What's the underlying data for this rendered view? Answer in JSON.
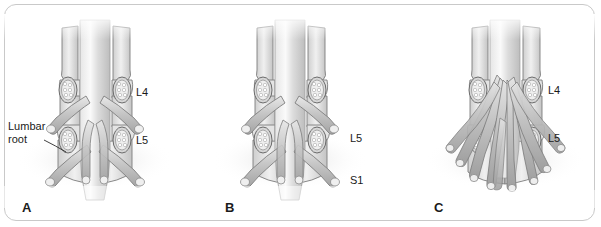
{
  "figure": {
    "type": "medical-illustration",
    "background_color": "#ffffff",
    "frame_color": "#c9c9c9",
    "panel_count": 3
  },
  "palette": {
    "ink": "#1a1a1a",
    "outline": "#6e6e6e",
    "bone_light": "#ececec",
    "bone_mid": "#d2d2d2",
    "bone_dark": "#b4b4b4",
    "root_light": "#e2e2e2",
    "root_mid": "#bdbdbd",
    "root_dark": "#9a9a9a",
    "sac_light": "#f2f2f2",
    "sac_mid": "#d8d8d8",
    "shadow": "#cfcfcf"
  },
  "panels": [
    {
      "id": "A",
      "letter": "A",
      "letter_x": 22,
      "letter_y": 200,
      "center_x": 95,
      "root_count": 4,
      "root_style": "splayed",
      "labels": [
        {
          "name": "lumbar-root",
          "text": "Lumbar\nroot",
          "x": 8,
          "y": 120,
          "align": "left"
        },
        {
          "name": "l4",
          "text": "L4",
          "x": 136,
          "y": 86,
          "align": "left"
        },
        {
          "name": "l5",
          "text": "L5",
          "x": 136,
          "y": 134,
          "align": "left"
        }
      ]
    },
    {
      "id": "B",
      "letter": "B",
      "letter_x": 225,
      "letter_y": 200,
      "center_x": 290,
      "root_count": 4,
      "root_style": "splayed",
      "labels": [
        {
          "name": "l5",
          "text": "L5",
          "x": 350,
          "y": 132,
          "align": "left"
        },
        {
          "name": "s1",
          "text": "S1",
          "x": 350,
          "y": 174,
          "align": "left"
        }
      ]
    },
    {
      "id": "C",
      "letter": "C",
      "letter_x": 434,
      "letter_y": 200,
      "center_x": 505,
      "root_count": 9,
      "root_style": "redundant-crowded",
      "labels": [
        {
          "name": "l4",
          "text": "L4",
          "x": 548,
          "y": 84,
          "align": "left"
        },
        {
          "name": "l5",
          "text": "L5",
          "x": 548,
          "y": 132,
          "align": "left"
        }
      ]
    }
  ]
}
